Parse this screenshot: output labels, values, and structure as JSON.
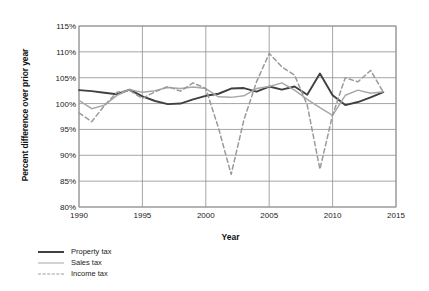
{
  "chart_data": {
    "type": "line",
    "title": "",
    "xlabel": "Year",
    "ylabel": "Percent difference over prior year",
    "xlim": [
      1990,
      2015
    ],
    "ylim": [
      80,
      115
    ],
    "ytick_step": 5,
    "grid": true,
    "legend_position": "bottom-left",
    "x": [
      1990,
      1991,
      1992,
      1993,
      1994,
      1995,
      1996,
      1997,
      1998,
      1999,
      2000,
      2001,
      2002,
      2003,
      2004,
      2005,
      2006,
      2007,
      2008,
      2009,
      2010,
      2011,
      2012,
      2013,
      2014
    ],
    "xticks": [
      "1990",
      "1995",
      "2000",
      "2005",
      "2010",
      "2015"
    ],
    "yticks": [
      "80%",
      "85%",
      "90%",
      "95%",
      "100%",
      "105%",
      "110%",
      "115%"
    ],
    "series": [
      {
        "name": "Property tax",
        "color": "#404040",
        "style": "solid",
        "values": [
          102.6,
          102.4,
          102.1,
          101.8,
          102.7,
          101.4,
          100.5,
          99.9,
          100.0,
          100.8,
          101.5,
          101.9,
          102.9,
          103.0,
          102.3,
          103.3,
          102.7,
          103.3,
          101.7,
          105.8,
          101.6,
          99.7,
          100.3,
          101.2,
          102.2
        ]
      },
      {
        "name": "Sales tax",
        "color": "#a8a8a8",
        "style": "solid",
        "values": [
          100.6,
          99.0,
          99.7,
          101.6,
          102.7,
          102.2,
          102.5,
          103.1,
          102.9,
          103.2,
          102.9,
          101.3,
          101.2,
          101.5,
          102.9,
          103.3,
          104.0,
          102.6,
          100.8,
          99.2,
          97.7,
          101.6,
          102.6,
          102.0,
          102.3
        ]
      },
      {
        "name": "Income tax",
        "color": "#9a9a9a",
        "style": "dashed",
        "values": [
          98.2,
          96.5,
          99.6,
          102.2,
          102.5,
          101.0,
          102.3,
          103.3,
          102.4,
          104.0,
          102.9,
          95.3,
          86.3,
          96.8,
          104.2,
          109.7,
          107.1,
          105.5,
          99.7,
          87.3,
          97.8,
          105.0,
          104.2,
          106.4,
          102.2
        ]
      }
    ]
  },
  "axes": {
    "y_title": "Percent difference over prior year",
    "x_title": "Year"
  },
  "legend": {
    "items": [
      {
        "label": "Property tax",
        "key": "property"
      },
      {
        "label": "Sales tax",
        "key": "sales"
      },
      {
        "label": "Income tax",
        "key": "income"
      }
    ]
  }
}
